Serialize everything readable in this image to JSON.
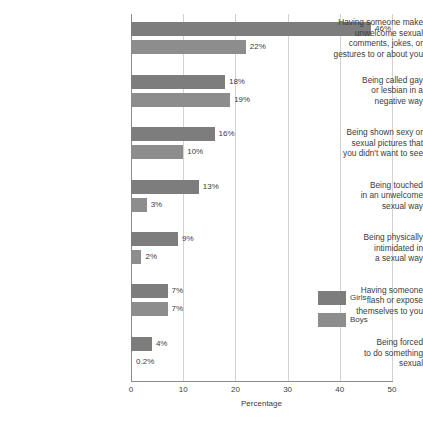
{
  "chart_data": {
    "type": "bar",
    "orientation": "horizontal",
    "title": "",
    "xlabel": "Percentage",
    "ylabel": "",
    "xlim": [
      0,
      50
    ],
    "xticks": [
      0,
      10,
      20,
      30,
      40,
      50
    ],
    "xtick_labels": [
      "0",
      "10",
      "20",
      "30",
      "40",
      "50"
    ],
    "grid": "vertical",
    "legend_position": "right-middle",
    "categories": [
      "Having someone make\nunwelcome sexual\ncomments, jokes, or\ngestures to or about you",
      "Being called gay\nor lesbian in a\nnegative way",
      "Being shown sexy or\nsexual pictures that\nyou didn't want to see",
      "Being touched\nin an unwelcome\nsexual way",
      "Being physically\nintimidated in\na sexual way",
      "Having someone\nflash or expose\nthemselves to you",
      "Being forced\nto do something\nsexual"
    ],
    "series": [
      {
        "name": "Girls",
        "color": "#7d7d7d",
        "values": [
          46,
          18,
          16,
          13,
          9,
          7,
          4
        ],
        "value_labels": [
          "46%",
          "18%",
          "16%",
          "13%",
          "9%",
          "7%",
          "4%"
        ]
      },
      {
        "name": "Boys",
        "color": "#8d8d8d",
        "values": [
          22,
          19,
          10,
          3,
          2,
          7,
          0.2
        ],
        "value_labels": [
          "22%",
          "19%",
          "10%",
          "3%",
          "2%",
          "7%",
          "0.2%"
        ]
      }
    ]
  },
  "legend": {
    "items": [
      {
        "label": "Girls",
        "color": "#7d7d7d"
      },
      {
        "label": "Boys",
        "color": "#8d8d8d"
      }
    ]
  },
  "axis": {
    "x_title": "Percentage"
  }
}
